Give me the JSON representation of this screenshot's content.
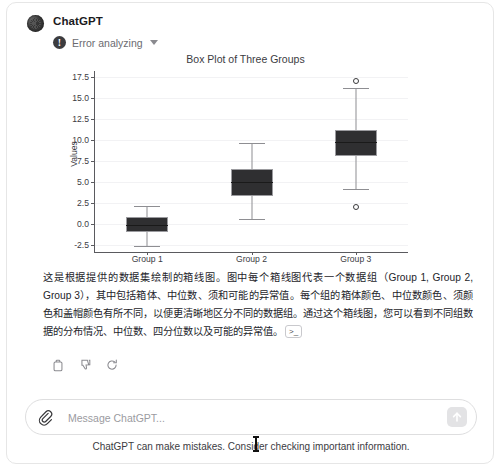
{
  "window": {
    "assistant_name": "ChatGPT",
    "error_label": "Error analyzing",
    "error_badge_glyph": "!"
  },
  "answer": {
    "paragraph": "这是根据提供的数据集绘制的箱线图。图中每个箱线图代表一个数据组（Group 1, Group 2, Group 3），其中包括箱体、中位数、须和可能的异常值。每个组的箱体颜色、中位数颜色、须颜色和盖帽颜色有所不同，以便更清晰地区分不同的数据组。通过这个箱线图，您可以看到不同组数据的分布情况、中位数、四分位数以及可能的异常值。",
    "citation_chip": ">_"
  },
  "actions": [
    {
      "name": "copy-icon",
      "label": "Copy"
    },
    {
      "name": "thumbs-down-icon",
      "label": "Bad response"
    },
    {
      "name": "regenerate-icon",
      "label": "Regenerate"
    }
  ],
  "composer": {
    "placeholder": "Message ChatGPT...",
    "value": "",
    "attach_icon": "paperclip-icon",
    "send_icon": "arrow-up-icon"
  },
  "footer": {
    "note": "ChatGPT can make mistakes. Consider checking important information."
  },
  "chart_data": {
    "type": "box",
    "title": "Box Plot of Three Groups",
    "xlabel": "",
    "ylabel": "Values",
    "categories": [
      "Group 1",
      "Group 2",
      "Group 3"
    ],
    "ytick_labels": [
      "17.5",
      "15.0",
      "12.5",
      "10.0",
      "7.5",
      "5.0",
      "2.5",
      "0.0",
      "-2.5"
    ],
    "yticks": [
      17.5,
      15.0,
      12.5,
      10.0,
      7.5,
      5.0,
      2.5,
      0.0,
      -2.5
    ],
    "ylim": [
      -3.3,
      18.2
    ],
    "grid": true,
    "legend": "none",
    "boxes": [
      {
        "name": "Group 1",
        "whisker_low": -2.6,
        "q1": -0.9,
        "median": -0.1,
        "q3": 0.8,
        "whisker_high": 2.2,
        "outliers": []
      },
      {
        "name": "Group 2",
        "whisker_low": 0.6,
        "q1": 3.4,
        "median": 5.0,
        "q3": 6.6,
        "whisker_high": 9.7,
        "outliers": []
      },
      {
        "name": "Group 3",
        "whisker_low": 4.2,
        "q1": 8.1,
        "median": 9.8,
        "q3": 11.2,
        "whisker_high": 16.2,
        "outliers": [
          17.0,
          2.0
        ]
      }
    ]
  },
  "colors": {
    "box_fill": "#2f2f31",
    "whisker": "#8e8e92",
    "axis": "#5a5a5e",
    "grid": "#f2f2f4",
    "text": "#24242a"
  }
}
